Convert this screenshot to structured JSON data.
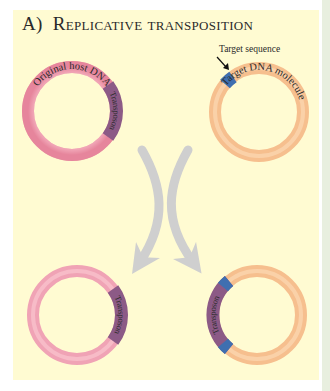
{
  "figure": {
    "panel_letter": "A)",
    "title": "Replicative transposition",
    "colors": {
      "background": "#fffbd2",
      "host_dna": "#f4a9b8",
      "target_dna": "#f9c99a",
      "transposon": "#8c5a86",
      "target_sequence": "#3f6fb0",
      "arrow": "#cfcfcf"
    }
  },
  "top_left": {
    "label_dna": "Original host DNA",
    "label_transposon": "Transposon"
  },
  "top_right": {
    "callout": "Target sequence",
    "label_dna": "Target DNA molecule"
  },
  "bottom_left": {
    "label_transposon": "Transposon"
  },
  "bottom_right": {
    "label_transposon": "Transposon"
  }
}
